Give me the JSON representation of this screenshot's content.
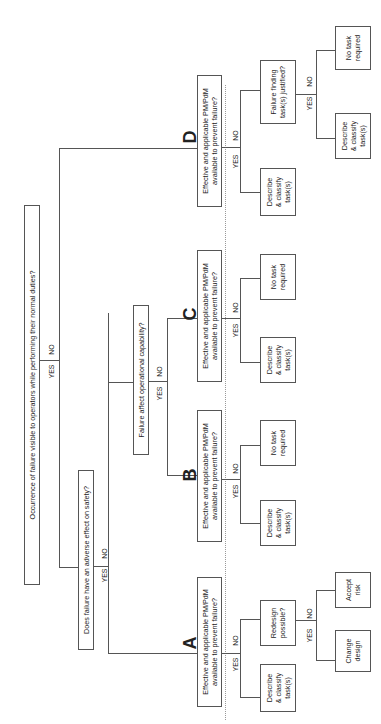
{
  "diagram": {
    "orientation": "rotated-90-ccw",
    "root_question": "Occurrence of failure visible to operators while performing their normal duties?",
    "safety_question": "Does failure have an adverse effect on safety?",
    "capability_question": "Failure affect operational capability?",
    "yes": "YES",
    "no": "NO",
    "branches": {
      "A": {
        "letter": "A",
        "question": "Effective and applicable PM/PdM available to prevent failure?",
        "yes_result": "Describe & classify task(s)",
        "no_question": "Redesign possible?",
        "no_yes_result": "Change design",
        "no_no_result": "Accept risk"
      },
      "B": {
        "letter": "B",
        "question": "Effective and applicable PM/PdM available to prevent failure?",
        "yes_result": "Describe & classify task(s)",
        "no_result": "No task required"
      },
      "C": {
        "letter": "C",
        "question": "Effective and applicable PM/PdM available to prevent failure?",
        "yes_result": "Describe & classify task(s)",
        "no_result": "No task required"
      },
      "D": {
        "letter": "D",
        "question": "Effective and applicable PM/PdM available to prevent failure?",
        "yes_result": "Describe & classify task(s)",
        "no_question": "Failure finding task(s) justified?",
        "no_yes_result": "Describe & classify task(s)",
        "no_no_result": "No task required"
      }
    },
    "text_lines": {
      "eff1": "Effective and applicable PM/PdM",
      "eff2": "available to prevent failure?",
      "desc1": "Describe",
      "desc2": "& classify",
      "desc3": "task(s)",
      "notask1": "No task",
      "notask2": "required",
      "redesign1": "Redesign",
      "redesign2": "possible?",
      "change1": "Change",
      "change2": "design",
      "accept1": "Accept",
      "accept2": "risk",
      "ff1": "Failure finding",
      "ff2": "task(s) justified?"
    }
  }
}
